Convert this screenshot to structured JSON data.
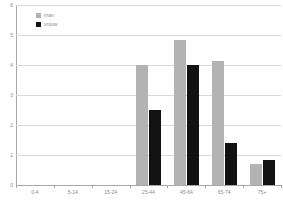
{
  "chart_data": {
    "type": "bar",
    "title": "",
    "subtitle": "",
    "xlabel": "",
    "ylabel": "",
    "categories": [
      "0-4",
      "5-14",
      "15-24",
      "25-44",
      "45-64",
      "65-74",
      "75+"
    ],
    "series": [
      {
        "name": "man",
        "color": "#b3b3b3",
        "values": [
          0,
          0,
          0,
          4.0,
          4.85,
          4.15,
          0.7
        ]
      },
      {
        "name": "vrouw",
        "color": "#121212",
        "values": [
          0,
          0,
          0,
          2.5,
          4.0,
          1.4,
          0.82
        ]
      }
    ],
    "ylim": [
      0,
      6
    ],
    "yticks": [
      0,
      1,
      2,
      3,
      4,
      5,
      6
    ],
    "ytick_labels": [
      "0",
      "1",
      "2",
      "3",
      "4",
      "5",
      "6"
    ],
    "grid": true,
    "grid_axis": "y",
    "grid_color": "#dadada",
    "legend_position": "upper left",
    "background_color": "#ffffff",
    "axis_color": "#a8a8a8",
    "tick_label_color": "#8a8a8a"
  },
  "legend": {
    "entries": [
      {
        "label": "man"
      },
      {
        "label": "vrouw"
      }
    ]
  }
}
